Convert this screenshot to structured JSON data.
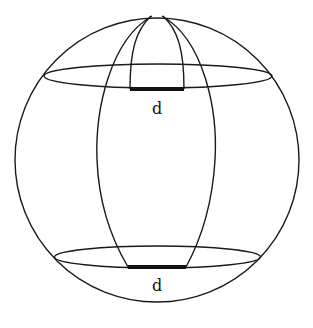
{
  "diagram": {
    "labels": {
      "top_width": "d",
      "bottom_width": "d"
    },
    "colors": {
      "line": "#1a1a1a",
      "background": "#ffffff"
    },
    "geometry": {
      "sphere": {
        "cx": 157,
        "cy": 160,
        "r": 142
      },
      "upper_circle": {
        "cx": 158,
        "cy": 76,
        "rx": 114,
        "ry": 12
      },
      "lower_circle": {
        "cx": 157.5,
        "cy": 257,
        "rx": 103,
        "ry": 11
      },
      "upper_segment": {
        "x1": 130,
        "x2": 184,
        "y": 89
      },
      "lower_segment": {
        "x1": 128,
        "x2": 186,
        "y": 267
      }
    }
  }
}
